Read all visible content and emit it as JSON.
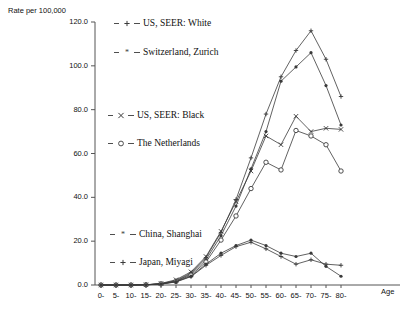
{
  "chart_data": {
    "type": "line",
    "title": "",
    "ylabel": "Rate per 100,000",
    "xlabel": "Age",
    "ylim": [
      0,
      120
    ],
    "yticks": [
      "0.0",
      "20.0",
      "40.0",
      "60.0",
      "80.0",
      "100.0",
      "120.0"
    ],
    "ytick_values": [
      0,
      20,
      40,
      60,
      80,
      100,
      120
    ],
    "grid": false,
    "legend_position": "inside-plot",
    "categories": [
      "0-",
      "5-",
      "10-",
      "15-",
      "20-",
      "25-",
      "30-",
      "35-",
      "40-",
      "45-",
      "50-",
      "55-",
      "60-",
      "65-",
      "70-",
      "75-",
      "80-"
    ],
    "series": [
      {
        "name": "US, SEER: White",
        "marker": "+",
        "values": [
          0,
          0,
          0,
          0.2,
          1.3,
          8.0,
          25.0,
          58.0,
          93.0,
          125.0,
          150.0,
          190.0,
          230.0,
          265.0,
          295.0,
          310.0,
          300.0
        ]
      },
      {
        "name": "Switzerland, Zurich",
        "marker": "*",
        "values": [
          0,
          0,
          0,
          0.2,
          1.2,
          7.0,
          22.0,
          52.0,
          88.0,
          118.0,
          140.0,
          175.0,
          215.0,
          250.0,
          280.0,
          290.0,
          270.0
        ]
      },
      {
        "name": "US, SEER: Black",
        "marker": "x",
        "values": [
          0,
          0,
          0,
          0.2,
          1.5,
          9.0,
          28.0,
          55.0,
          80.0,
          100.0,
          112.0,
          120.0,
          130.0,
          145.0,
          150.0,
          143.0,
          140.0
        ]
      },
      {
        "name": "The Netherlands",
        "marker": "o",
        "values": [
          0,
          0,
          0,
          0.2,
          1.1,
          7.5,
          24.0,
          50.0,
          78.0,
          98.0,
          110.0,
          118.0,
          128.0,
          140.0,
          148.0,
          135.0,
          118.0
        ]
      },
      {
        "name": "China, Shanghai",
        "marker": "*",
        "values": [
          0,
          0,
          0,
          0.1,
          0.6,
          3.0,
          9.0,
          17.0,
          24.0,
          30.0,
          34.0,
          36.0,
          35.0,
          31.0,
          26.0,
          22.0,
          18.0
        ]
      },
      {
        "name": "Japan, Miyagi",
        "marker": "+",
        "values": [
          0,
          0,
          0,
          0.1,
          0.7,
          3.5,
          10.0,
          19.0,
          27.0,
          33.0,
          36.0,
          34.0,
          30.0,
          26.0,
          23.0,
          21.0,
          20.0
        ]
      }
    ],
    "plot_values_scale_note": "values are plotted as rate per 100,000 mapped to 0-120 axis",
    "plotted": {
      "US, SEER: White": [
        0.0,
        0.0,
        0.0,
        0.1,
        0.6,
        2.0,
        5.5,
        12.5,
        24.0,
        39.0,
        58.0,
        78.0,
        95.0,
        107.0,
        116.0,
        103.0,
        86.0
      ],
      "Switzerland, Zurich": [
        0.0,
        0.0,
        0.0,
        0.1,
        0.5,
        1.8,
        5.0,
        11.5,
        22.5,
        36.0,
        53.0,
        70.0,
        93.0,
        99.5,
        106.0,
        91.0,
        73.0
      ],
      "US, SEER: Black": [
        0.0,
        0.0,
        0.0,
        0.1,
        0.7,
        2.4,
        6.0,
        13.0,
        24.5,
        38.0,
        52.0,
        68.0,
        64.0,
        77.0,
        70.0,
        71.5,
        71.0
      ],
      "The Netherlands": [
        0.0,
        0.0,
        0.0,
        0.1,
        0.5,
        1.6,
        4.5,
        10.5,
        20.5,
        31.5,
        44.0,
        56.0,
        52.5,
        70.5,
        68.0,
        64.0,
        52.0
      ],
      "China, Shanghai": [
        0.0,
        0.0,
        0.0,
        0.1,
        0.4,
        1.5,
        4.0,
        9.5,
        14.5,
        18.0,
        20.5,
        18.0,
        14.5,
        13.0,
        14.5,
        8.5,
        4.0
      ],
      "Japan, Miyagi": [
        0.0,
        0.0,
        0.0,
        0.1,
        0.4,
        1.4,
        3.8,
        9.0,
        13.5,
        17.5,
        19.5,
        16.5,
        13.0,
        9.5,
        11.5,
        9.5,
        9.0
      ]
    }
  },
  "legend": [
    {
      "label": "US, SEER: White",
      "marker": "+",
      "name": "legend-item-us-seer-white"
    },
    {
      "label": "Switzerland, Zurich",
      "marker": "*",
      "name": "legend-item-switzerland-zurich"
    },
    {
      "label": "US, SEER: Black",
      "marker": "x",
      "name": "legend-item-us-seer-black"
    },
    {
      "label": "The Netherlands",
      "marker": "o",
      "name": "legend-item-the-netherlands"
    },
    {
      "label": "China, Shanghai",
      "marker": "*",
      "name": "legend-item-china-shanghai"
    },
    {
      "label": "Japan, Miyagi",
      "marker": "+",
      "name": "legend-item-japan-miyagi"
    }
  ],
  "axes": {
    "y_title": "Rate per 100,000",
    "x_title": "Age"
  },
  "colors": {
    "line": "#3a3a3a",
    "text": "#111111",
    "axis": "#555555",
    "background": "#ffffff"
  }
}
